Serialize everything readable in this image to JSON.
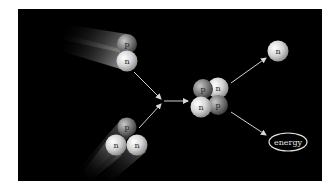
{
  "diagram": {
    "type": "nuclear-fusion-reaction",
    "background_color": "#000000",
    "page_color": "#ffffff",
    "reactants": [
      {
        "name": "deuterium",
        "particles": [
          {
            "symbol": "p",
            "kind": "proton"
          },
          {
            "symbol": "n",
            "kind": "neutron"
          }
        ]
      },
      {
        "name": "tritium",
        "particles": [
          {
            "symbol": "p",
            "kind": "proton"
          },
          {
            "symbol": "n",
            "kind": "neutron"
          },
          {
            "symbol": "n",
            "kind": "neutron"
          }
        ]
      }
    ],
    "product_nucleus": {
      "name": "helium",
      "particles": [
        {
          "symbol": "p",
          "kind": "proton"
        },
        {
          "symbol": "n",
          "kind": "neutron"
        },
        {
          "symbol": "n",
          "kind": "neutron"
        },
        {
          "symbol": "p",
          "kind": "proton"
        }
      ]
    },
    "products": {
      "free_neutron": {
        "symbol": "n"
      },
      "energy": {
        "label": "energy"
      }
    },
    "colors": {
      "proton": "#7a7a7a",
      "neutron": "#d8d8d8",
      "arrow": "#d0d0d0"
    }
  }
}
